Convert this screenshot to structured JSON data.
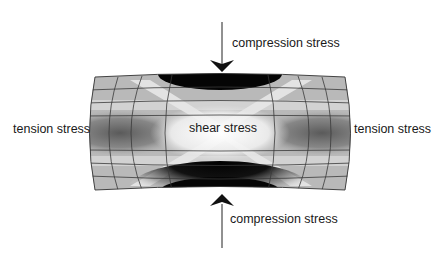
{
  "diagram": {
    "type": "stress-distribution-figure",
    "labels": {
      "compression_top": "compression stress",
      "compression_bottom": "compression stress",
      "tension_left": "tension stress",
      "tension_right": "tension stress",
      "shear_center": "shear stress"
    },
    "arrows": [
      {
        "name": "compression-arrow-top",
        "direction": "down"
      },
      {
        "name": "compression-arrow-bottom",
        "direction": "up"
      }
    ],
    "colors": {
      "background": "#ffffff",
      "text": "#1a1a1a",
      "compression_zone": "#0a0a0a",
      "tension_zone": "#6e6e6e",
      "shear_zone": "#f4f4f4",
      "mesh_lines": "#3a3a3a"
    }
  }
}
